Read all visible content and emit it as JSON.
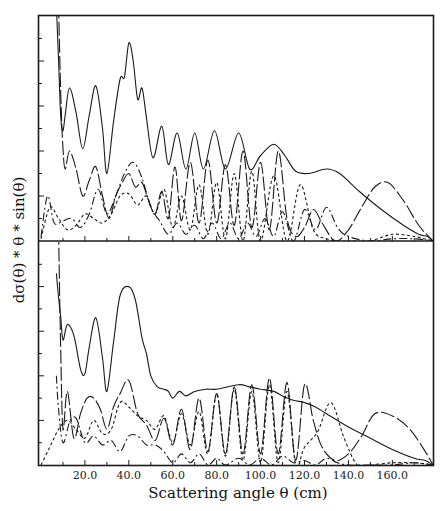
{
  "chart_data": [
    {
      "type": "line",
      "panel": "upper",
      "title": "",
      "xlabel": "",
      "ylabel": "dσ(θ) * θ * sin(θ)",
      "xlim": [
        0,
        178.5
      ],
      "ylim": [
        0,
        10
      ],
      "grid": false,
      "legend": null,
      "series": [
        {
          "name": "total",
          "style": "solid",
          "x": [
            7,
            8,
            9,
            10,
            11,
            13,
            16,
            19,
            22,
            25,
            28,
            30,
            33,
            36,
            38,
            40,
            42,
            44,
            46,
            48,
            51,
            55,
            58,
            62,
            66,
            70,
            74,
            79,
            84,
            90,
            95,
            100,
            106,
            111,
            116,
            122,
            130,
            136,
            145,
            155,
            165,
            172,
            176,
            178.5
          ],
          "y": [
            10.5,
            8.0,
            5.5,
            4.9,
            5.6,
            6.8,
            5.7,
            4.1,
            5.6,
            6.9,
            5.0,
            3.0,
            5.3,
            7.2,
            7.3,
            8.8,
            8.0,
            6.3,
            6.8,
            5.5,
            3.7,
            5.1,
            3.4,
            4.8,
            3.2,
            4.8,
            3.2,
            4.9,
            3.2,
            4.8,
            3.2,
            3.8,
            4.3,
            3.8,
            3.1,
            3.0,
            3.2,
            3.0,
            2.2,
            1.4,
            0.7,
            0.3,
            0.2,
            0.0
          ]
        },
        {
          "name": "component-long-dash",
          "style": "long-dash",
          "x": [
            8,
            9,
            10,
            11,
            13,
            16,
            19,
            22,
            25,
            28,
            31,
            34,
            37,
            40,
            43,
            46,
            49,
            52,
            55,
            58,
            61,
            64,
            68,
            72,
            76,
            80,
            84,
            88,
            92,
            96,
            100,
            104,
            108,
            112,
            116,
            120,
            124,
            128,
            134,
            140,
            146,
            152,
            158,
            165,
            172,
            178.5
          ],
          "y": [
            10.5,
            6.5,
            4.1,
            3.2,
            4.0,
            3.2,
            2.0,
            2.7,
            3.3,
            2.0,
            1.0,
            2.0,
            2.6,
            3.0,
            2.4,
            2.6,
            1.8,
            1.2,
            2.2,
            1.0,
            3.3,
            0.9,
            3.5,
            0.8,
            3.6,
            0.8,
            3.4,
            0.7,
            4.0,
            0.6,
            3.5,
            0.5,
            4.0,
            1.0,
            0.2,
            0.6,
            1.4,
            0.8,
            0.0,
            0.5,
            1.5,
            2.4,
            2.6,
            1.8,
            0.7,
            0.0
          ]
        },
        {
          "name": "component-dash-dot",
          "style": "dash-dot",
          "x": [
            0,
            3,
            6,
            10,
            14,
            18,
            22,
            26,
            30,
            34,
            38,
            42,
            46,
            50,
            54,
            58,
            62,
            66,
            70,
            74,
            78,
            82,
            86,
            90,
            94,
            98,
            102,
            106,
            110,
            115,
            120,
            125,
            130,
            135,
            140,
            150,
            160,
            170,
            178.5
          ],
          "y": [
            0.2,
            2.0,
            0.8,
            0.9,
            1.0,
            0.6,
            1.2,
            2.3,
            1.2,
            2.0,
            3.0,
            3.5,
            2.8,
            1.5,
            0.9,
            0.3,
            0.8,
            0.3,
            0.7,
            0.1,
            0.8,
            0.1,
            0.8,
            0.1,
            0.8,
            0.2,
            1.0,
            0.2,
            1.3,
            0.0,
            1.4,
            0.5,
            1.5,
            0.6,
            0.2,
            0.0,
            0.1,
            0.1,
            0.0
          ]
        },
        {
          "name": "component-short-dash",
          "style": "short-dash",
          "x": [
            0,
            4,
            8,
            12,
            16,
            20,
            24,
            28,
            32,
            36,
            40,
            44,
            48,
            52,
            56,
            60,
            64,
            68,
            72,
            76,
            80,
            84,
            88,
            92,
            96,
            100,
            106,
            112,
            118,
            124,
            130,
            136,
            142,
            150,
            160,
            170,
            178.5
          ],
          "y": [
            0.1,
            1.5,
            1.0,
            0.5,
            0.7,
            1.2,
            1.0,
            0.8,
            1.2,
            2.0,
            2.1,
            1.6,
            2.0,
            1.2,
            2.3,
            0.6,
            2.0,
            0.5,
            2.5,
            0.3,
            2.6,
            0.1,
            3.0,
            0.0,
            3.1,
            0.0,
            2.9,
            0.0,
            2.5,
            0.5,
            0.1,
            0.0,
            0.0,
            0.0,
            0.3,
            0.2,
            0.0
          ]
        }
      ]
    },
    {
      "type": "line",
      "panel": "lower",
      "title": "",
      "xlabel": "Scattering angle θ (cm)",
      "ylabel": "dσ(θ) * θ * sin(θ)",
      "xlim": [
        0,
        178.5
      ],
      "ylim": [
        0,
        10
      ],
      "grid": false,
      "legend": null,
      "x_ticks": [
        20.0,
        40.0,
        60.0,
        80.0,
        100.0,
        120.0,
        140.0,
        160.0
      ],
      "x_tick_labels": [
        "20.0",
        "40.0",
        "60.0",
        "80.0",
        "100.0",
        "120.0",
        "140.0",
        "160.0"
      ],
      "series": [
        {
          "name": "total",
          "style": "solid",
          "x": [
            7,
            8,
            9,
            10,
            12,
            15,
            18,
            20,
            22,
            25,
            28,
            30,
            33,
            36,
            40,
            43,
            46,
            48,
            50,
            53,
            56,
            58,
            60,
            63,
            66,
            70,
            75,
            80,
            90,
            95,
            100,
            106,
            110,
            115,
            120,
            125,
            130,
            140,
            150,
            160,
            170,
            175,
            178.5
          ],
          "y": [
            8.6,
            7.5,
            6.6,
            5.6,
            6.3,
            5.8,
            4.3,
            4.1,
            5.3,
            6.6,
            4.8,
            3.3,
            5.5,
            7.6,
            8.0,
            7.4,
            5.7,
            5.0,
            4.0,
            3.5,
            3.4,
            3.3,
            3.0,
            3.3,
            3.1,
            3.3,
            3.4,
            3.4,
            3.6,
            3.5,
            3.4,
            3.3,
            3.1,
            2.9,
            2.8,
            2.6,
            2.3,
            1.7,
            1.2,
            0.7,
            0.3,
            0.2,
            0.0
          ]
        },
        {
          "name": "component-long-dash",
          "style": "long-dash",
          "x": [
            8,
            9,
            10,
            12,
            15,
            18,
            21,
            24,
            27,
            30,
            33,
            36,
            40,
            44,
            48,
            52,
            56,
            60,
            64,
            68,
            72,
            76,
            80,
            84,
            88,
            92,
            96,
            100,
            104,
            108,
            112,
            116,
            120,
            124,
            128,
            134,
            140,
            146,
            152,
            160,
            168,
            175,
            178.5
          ],
          "y": [
            10.5,
            5.0,
            1.6,
            3.3,
            1.2,
            2.3,
            3.0,
            3.0,
            2.5,
            1.6,
            2.6,
            3.2,
            3.8,
            2.3,
            1.8,
            1.1,
            2.1,
            0.9,
            2.5,
            0.7,
            3.0,
            0.6,
            3.2,
            0.5,
            3.5,
            0.5,
            3.6,
            0.5,
            3.9,
            0.5,
            3.7,
            0.2,
            3.6,
            2.0,
            0.8,
            0.2,
            0.5,
            1.3,
            2.3,
            2.2,
            1.6,
            0.6,
            0.0
          ]
        },
        {
          "name": "component-dash-dot",
          "style": "dash-dot",
          "x": [
            7,
            8,
            10,
            13,
            16,
            20,
            24,
            28,
            32,
            36,
            40,
            44,
            48,
            52,
            56,
            60,
            64,
            68,
            72,
            76,
            80,
            84,
            90,
            95,
            100,
            105,
            110,
            115,
            120,
            125,
            130,
            135,
            140,
            150,
            160,
            170,
            178.5
          ],
          "y": [
            4.0,
            2.5,
            1.0,
            1.9,
            2.1,
            1.0,
            1.3,
            0.9,
            1.1,
            0.6,
            1.3,
            1.3,
            0.9,
            0.9,
            0.6,
            0.1,
            0.5,
            0.1,
            0.5,
            0.0,
            0.3,
            0.0,
            0.3,
            0.0,
            0.3,
            0.0,
            0.4,
            0.1,
            0.2,
            0.0,
            0.3,
            0.1,
            0.0,
            0.0,
            0.0,
            0.1,
            0.0
          ]
        },
        {
          "name": "component-short-dash",
          "style": "short-dash",
          "x": [
            0,
            4,
            8,
            12,
            16,
            20,
            24,
            28,
            32,
            36,
            40,
            44,
            48,
            52,
            56,
            60,
            64,
            68,
            72,
            76,
            80,
            84,
            88,
            92,
            96,
            100,
            104,
            108,
            112,
            116,
            120,
            126,
            132,
            138,
            144,
            150,
            160,
            170,
            178.5
          ],
          "y": [
            0.0,
            0.8,
            1.6,
            2.0,
            1.6,
            1.2,
            2.0,
            1.4,
            1.6,
            2.8,
            2.6,
            2.2,
            2.0,
            1.6,
            2.2,
            1.0,
            2.3,
            0.9,
            2.4,
            0.5,
            3.2,
            0.4,
            3.4,
            0.2,
            3.3,
            0.1,
            3.6,
            0.1,
            3.3,
            0.0,
            0.8,
            1.5,
            2.8,
            1.2,
            0.0,
            0.0,
            0.1,
            0.1,
            0.0
          ]
        }
      ]
    }
  ],
  "axes": {
    "ylabel": "dσ(θ) * θ * sin(θ)",
    "xlabel": "Scattering angle θ (cm)",
    "x_tick_labels": [
      "20.0",
      "40.0",
      "60.0",
      "80.0",
      "100.0",
      "120.0",
      "140.0",
      "160.0"
    ]
  }
}
